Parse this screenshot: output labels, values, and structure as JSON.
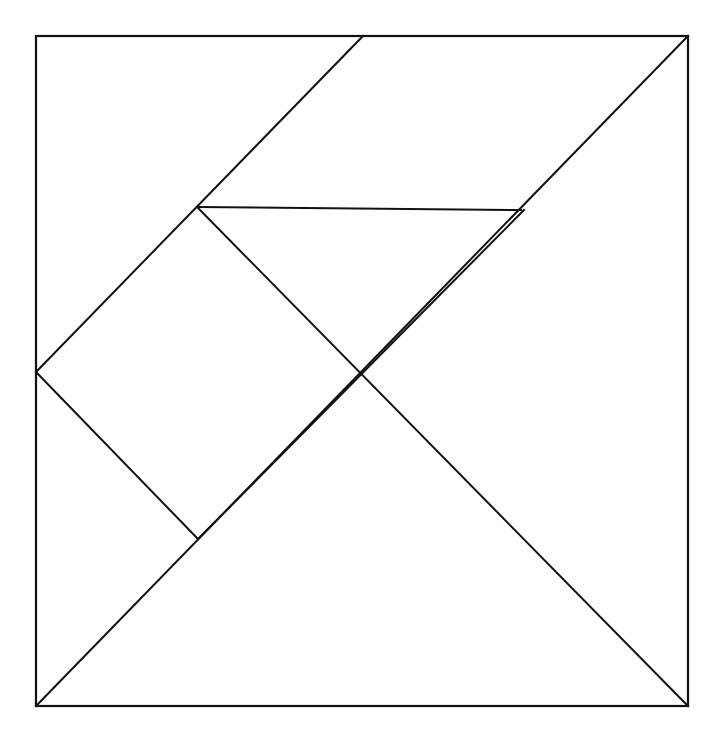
{
  "figure": {
    "background_color": "#ffffff",
    "line_color": "#121212",
    "line_width": 2,
    "canvas": {
      "width": 713,
      "height": 743
    }
  },
  "chart_data": {
    "type": "diagram",
    "xlabel": "",
    "ylabel": "",
    "square": {
      "top_left": [
        36,
        36
      ],
      "top_right": [
        688,
        36
      ],
      "bottom_right": [
        688,
        706
      ],
      "bottom_left": [
        36,
        706
      ],
      "width": 652,
      "height": 670
    },
    "vertices": {
      "A_top_left": [
        36,
        36
      ],
      "B_top_right": [
        688,
        36
      ],
      "C_bottom_right": [
        688,
        706
      ],
      "D_bottom_left": [
        36,
        706
      ],
      "E_top_edge_mid": [
        363,
        36
      ],
      "F_left_edge_mid": [
        36,
        372
      ],
      "G_upper_junction": [
        198,
        208
      ],
      "H_horizontal_right_end": [
        521,
        210
      ],
      "I_center_cross": [
        361,
        373
      ],
      "J_lower_junction": [
        198,
        539
      ]
    },
    "segments": [
      {
        "name": "outline-top",
        "from": [
          36,
          36
        ],
        "to": [
          688,
          36
        ]
      },
      {
        "name": "outline-right",
        "from": [
          688,
          36
        ],
        "to": [
          688,
          706
        ]
      },
      {
        "name": "outline-bottom",
        "from": [
          688,
          706
        ],
        "to": [
          36,
          706
        ]
      },
      {
        "name": "outline-left",
        "from": [
          36,
          706
        ],
        "to": [
          36,
          36
        ]
      },
      {
        "name": "main-diagonal",
        "from": [
          36,
          706
        ],
        "to": [
          688,
          36
        ]
      },
      {
        "name": "upper-left-diagonal",
        "from": [
          363,
          36
        ],
        "to": [
          36,
          372
        ]
      },
      {
        "name": "horizontal-bar",
        "from": [
          198,
          207
        ],
        "to": [
          521,
          210
        ]
      },
      {
        "name": "center-descending-diagonal",
        "from": [
          198,
          208
        ],
        "to": [
          688,
          706
        ]
      },
      {
        "name": "lower-left-short-diagonal",
        "from": [
          36,
          372
        ],
        "to": [
          198,
          539
        ]
      },
      {
        "name": "lower-ascending-diagonal",
        "from": [
          198,
          539
        ],
        "to": [
          524,
          210
        ]
      }
    ],
    "pieces": [
      {
        "name": "large-triangle-upper-left",
        "points": [
          [
            36,
            36
          ],
          [
            363,
            36
          ],
          [
            36,
            372
          ]
        ]
      },
      {
        "name": "large-triangle-lower-right",
        "points": [
          [
            36,
            706
          ],
          [
            688,
            706
          ],
          [
            688,
            36
          ]
        ]
      },
      {
        "name": "parallelogram-top",
        "points": [
          [
            363,
            36
          ],
          [
            688,
            36
          ],
          [
            521,
            210
          ],
          [
            198,
            207
          ]
        ]
      },
      {
        "name": "medium-triangle-center",
        "points": [
          [
            198,
            208
          ],
          [
            521,
            210
          ],
          [
            361,
            373
          ]
        ]
      },
      {
        "name": "square-left",
        "points": [
          [
            36,
            372
          ],
          [
            198,
            208
          ],
          [
            361,
            373
          ],
          [
            198,
            539
          ]
        ]
      },
      {
        "name": "small-triangle-lower-left",
        "points": [
          [
            36,
            372
          ],
          [
            198,
            539
          ],
          [
            36,
            706
          ]
        ]
      },
      {
        "name": "triangle-lower-center",
        "points": [
          [
            198,
            539
          ],
          [
            361,
            373
          ],
          [
            688,
            706
          ],
          [
            36,
            706
          ]
        ]
      }
    ],
    "grid": false,
    "legend": null
  }
}
